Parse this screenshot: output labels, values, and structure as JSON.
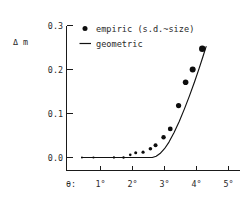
{
  "chart_data": {
    "type": "scatter",
    "title": "",
    "subtitle": "",
    "xlabel": "θ:",
    "ylabel": "Δ m",
    "xlim": [
      0.35,
      5.35
    ],
    "ylim": [
      -0.018,
      0.3
    ],
    "grid": false,
    "legend_position": "top-left-inside",
    "x_tick_labels": [
      "1°",
      "2°",
      "3°",
      "4°",
      "5°"
    ],
    "x_tick_values": [
      1,
      2,
      3,
      4,
      5
    ],
    "y_tick_labels": [
      "0.0",
      "0.1",
      "0.2",
      "0.3"
    ],
    "y_tick_values": [
      0.0,
      0.1,
      0.2,
      0.3
    ],
    "series": [
      {
        "name": "empiric (s.d.~size)",
        "type": "scatter",
        "marker": "filled-circle",
        "note": "marker size proportional to standard deviation",
        "points": [
          {
            "x": 0.42,
            "y": 0.0,
            "size": 2.0
          },
          {
            "x": 0.78,
            "y": 0.0,
            "size": 2.2
          },
          {
            "x": 1.42,
            "y": 0.0,
            "size": 2.3
          },
          {
            "x": 1.72,
            "y": 0.0,
            "size": 2.4
          },
          {
            "x": 1.93,
            "y": 0.006,
            "size": 2.6
          },
          {
            "x": 2.1,
            "y": 0.011,
            "size": 3.0
          },
          {
            "x": 2.33,
            "y": 0.012,
            "size": 3.2
          },
          {
            "x": 2.56,
            "y": 0.02,
            "size": 3.6
          },
          {
            "x": 2.72,
            "y": 0.028,
            "size": 4.0
          },
          {
            "x": 2.97,
            "y": 0.046,
            "size": 4.4
          },
          {
            "x": 3.18,
            "y": 0.065,
            "size": 4.8
          },
          {
            "x": 3.44,
            "y": 0.118,
            "size": 5.2
          },
          {
            "x": 3.66,
            "y": 0.171,
            "size": 5.6
          },
          {
            "x": 3.88,
            "y": 0.2,
            "size": 6.0
          },
          {
            "x": 4.18,
            "y": 0.247,
            "size": 6.4
          }
        ]
      },
      {
        "name": "geometric",
        "type": "line",
        "points": [
          {
            "x": 0.42,
            "y": 0.0
          },
          {
            "x": 1.6,
            "y": 0.0
          },
          {
            "x": 2.3,
            "y": 0.0
          },
          {
            "x": 2.62,
            "y": 0.0
          },
          {
            "x": 2.74,
            "y": 0.003
          },
          {
            "x": 2.86,
            "y": 0.009
          },
          {
            "x": 3.0,
            "y": 0.02
          },
          {
            "x": 3.14,
            "y": 0.035
          },
          {
            "x": 3.3,
            "y": 0.057
          },
          {
            "x": 3.46,
            "y": 0.082
          },
          {
            "x": 3.62,
            "y": 0.11
          },
          {
            "x": 3.78,
            "y": 0.14
          },
          {
            "x": 3.94,
            "y": 0.172
          },
          {
            "x": 4.08,
            "y": 0.202
          },
          {
            "x": 4.2,
            "y": 0.229
          },
          {
            "x": 4.3,
            "y": 0.252
          }
        ]
      }
    ]
  },
  "legend": {
    "entries": [
      {
        "label": "empiric (s.d.~size)",
        "marker": "dot"
      },
      {
        "label": "geometric",
        "marker": "line"
      }
    ]
  },
  "colors": {
    "marker": "#0d0d0d",
    "curve": "#111111",
    "axis": "#1a1a1a",
    "text": "#2b2b2b",
    "background": "#ffffff"
  }
}
